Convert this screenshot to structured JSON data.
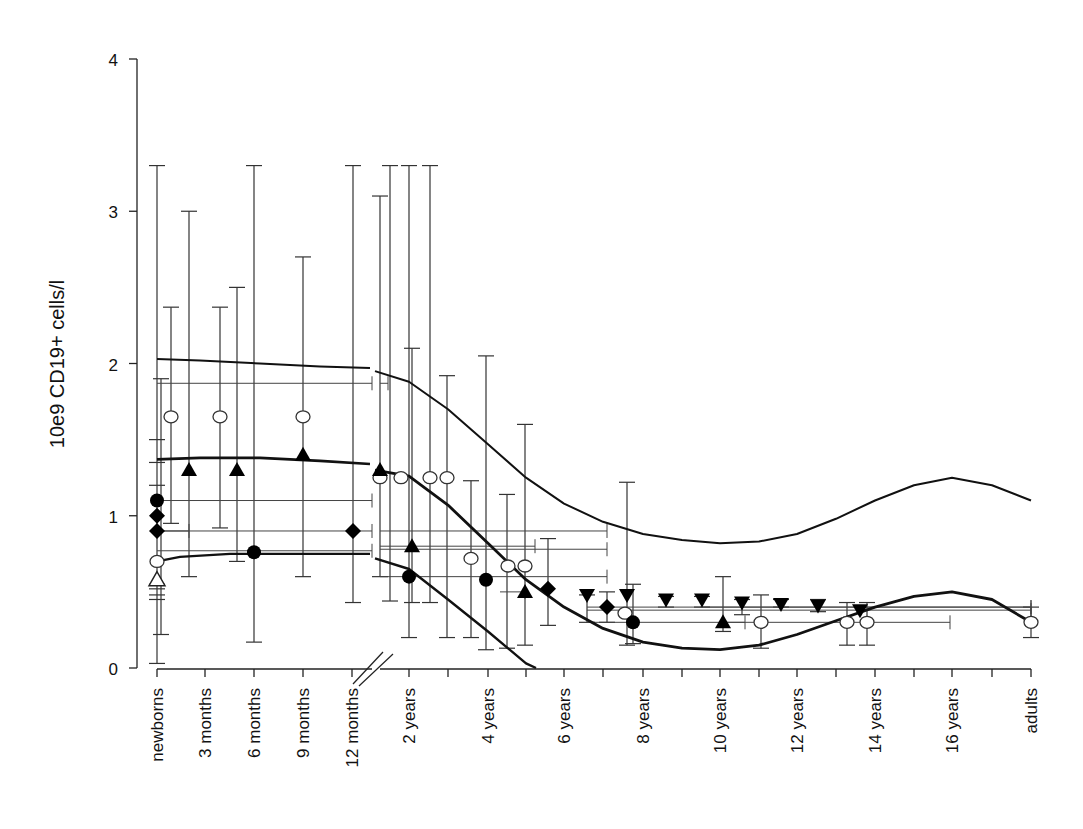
{
  "chart_data": {
    "type": "scatter",
    "title": "",
    "xlabel": "",
    "ylabel": "10e9 CD19+ cells/l",
    "ylim": [
      0,
      4
    ],
    "yticks": [
      0,
      1,
      2,
      3,
      4
    ],
    "grid": false,
    "legend": null,
    "x_axis_break": "between 12 months and 2 years",
    "categories": [
      "newborns",
      "3 months",
      "6 months",
      "9 months",
      "12 months",
      "2 years",
      "4 years",
      "6 years",
      "8 years",
      "10 years",
      "12 years",
      "14 years",
      "16 years",
      "adults"
    ],
    "series": [
      {
        "name": "open circles",
        "marker": "open-circle",
        "points": [
          {
            "x": "newborns",
            "y": 0.7
          },
          {
            "x": "~1 month",
            "y": 1.65
          },
          {
            "x": "~4 months",
            "y": 1.65
          },
          {
            "x": "9 months",
            "y": 1.65
          },
          {
            "x": "~1.5 years",
            "y": 1.25
          },
          {
            "x": "~2 years",
            "y": 1.25
          },
          {
            "x": "~2.5 years",
            "y": 1.25
          },
          {
            "x": "~3 years",
            "y": 1.25
          },
          {
            "x": "~3.5 years",
            "y": 0.72
          },
          {
            "x": "~4.5 years",
            "y": 0.67
          },
          {
            "x": "~5 years",
            "y": 0.67
          },
          {
            "x": "~7.5 years",
            "y": 0.36
          },
          {
            "x": "~11 years",
            "y": 0.3
          },
          {
            "x": "~13.5 years",
            "y": 0.3
          },
          {
            "x": "~14 years",
            "y": 0.3
          },
          {
            "x": "adults",
            "y": 0.3
          }
        ]
      },
      {
        "name": "filled triangles (up)",
        "marker": "filled-triangle-up",
        "points": [
          {
            "x": "~2 months",
            "y": 1.3
          },
          {
            "x": "~5 months",
            "y": 1.3
          },
          {
            "x": "9 months",
            "y": 1.4
          },
          {
            "x": "~1.5 years",
            "y": 1.3
          },
          {
            "x": "~2 years",
            "y": 0.8
          },
          {
            "x": "~5 years",
            "y": 0.5
          },
          {
            "x": "~10.5 years",
            "y": 0.3
          }
        ]
      },
      {
        "name": "open triangle (up)",
        "marker": "open-triangle-up",
        "points": [
          {
            "x": "newborns",
            "y": 0.58
          }
        ]
      },
      {
        "name": "filled circles",
        "marker": "filled-circle",
        "points": [
          {
            "x": "newborns",
            "y": 1.1
          },
          {
            "x": "6 months",
            "y": 0.76
          },
          {
            "x": "~2 years",
            "y": 0.6
          },
          {
            "x": "4 years",
            "y": 0.58
          },
          {
            "x": "~7.5 years",
            "y": 0.3
          }
        ]
      },
      {
        "name": "filled diamonds",
        "marker": "filled-diamond",
        "points": [
          {
            "x": "newborns",
            "y": 1.0
          },
          {
            "x": "newborns",
            "y": 0.9
          },
          {
            "x": "12 months",
            "y": 0.9
          },
          {
            "x": "~5.5 years",
            "y": 0.52
          },
          {
            "x": "~7 years",
            "y": 0.4
          }
        ]
      },
      {
        "name": "filled triangles (down)",
        "marker": "filled-triangle-down",
        "points": [
          {
            "x": "~6.5 years",
            "y": 0.48
          },
          {
            "x": "~7.5 years",
            "y": 0.48
          },
          {
            "x": "~8.5 years",
            "y": 0.45
          },
          {
            "x": "~9.5 years",
            "y": 0.45
          },
          {
            "x": "~10.5 years",
            "y": 0.43
          },
          {
            "x": "~11.5 years",
            "y": 0.42
          },
          {
            "x": "~12.5 years",
            "y": 0.41
          },
          {
            "x": "~13.5 years",
            "y": 0.38
          }
        ]
      }
    ],
    "reference_curves": [
      {
        "name": "upper limit",
        "description": "~2.03 at birth declining to ~1.97 at 12 months; ~1.95 at 1.5 y falling to ~0.82 at 10 y, rising to ~1.25 at 16 y, ~1.1 at adults"
      },
      {
        "name": "median",
        "description": "~1.37 at birth to ~1.34 at 12 months; ~1.3 at 1.5 y falling to ~0.12 at 10 y, rising to ~0.5 at 16 y, ~0.3 at adults"
      },
      {
        "name": "lower limit",
        "description": "~0.7 at birth rising to ~0.75 at 12 months; ~0.72 at 1.5 y falling to 0 near 5 y"
      }
    ]
  },
  "axes": {
    "y_label": "10e9 CD19+ cells/l",
    "y_ticks": [
      "0",
      "1",
      "2",
      "3",
      "4"
    ],
    "x_ticks": [
      "newborns",
      "3 months",
      "6 months",
      "9 months",
      "12 months",
      "2 years",
      "4 years",
      "6 years",
      "8 years",
      "10 years",
      "12 years",
      "14 years",
      "16 years",
      "adults"
    ]
  }
}
